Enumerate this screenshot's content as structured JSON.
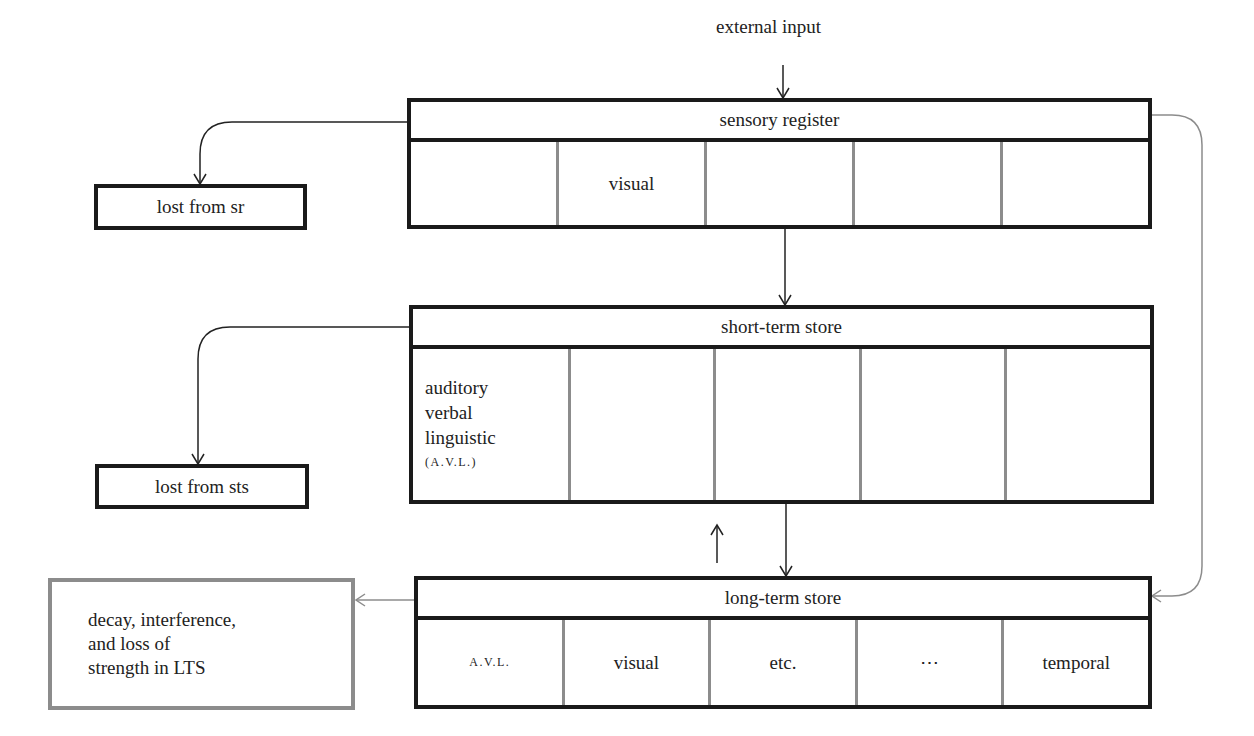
{
  "diagram": {
    "type": "memory-model-flowchart",
    "external_input": "external input",
    "sensory_register": {
      "title": "sensory register",
      "cells": [
        "",
        "visual",
        "",
        "",
        ""
      ]
    },
    "short_term_store": {
      "title": "short-term store",
      "cells": [
        {
          "lines": [
            "auditory",
            "verbal",
            "linguistic",
            "(A.V.L.)"
          ]
        },
        {
          "lines": []
        },
        {
          "lines": []
        },
        {
          "lines": []
        },
        {
          "lines": []
        }
      ],
      "cell0_line1": "auditory",
      "cell0_line2": "verbal",
      "cell0_line3": "linguistic",
      "cell0_line4": "(A.V.L.)"
    },
    "long_term_store": {
      "title": "long-term store",
      "cells": [
        "A.V.L.",
        "visual",
        "etc.",
        "⋯",
        "temporal"
      ]
    },
    "lost_from_sr": "lost from sr",
    "lost_from_sts": "lost from sts",
    "decay_box": {
      "line1": "decay, interference,",
      "line2": "and loss of",
      "line3": "strength in LTS"
    },
    "colors": {
      "box_border": "#1a1a1a",
      "divider": "#8c8c8c",
      "gray_path": "#8c8c8c",
      "arrow": "#222222"
    }
  }
}
